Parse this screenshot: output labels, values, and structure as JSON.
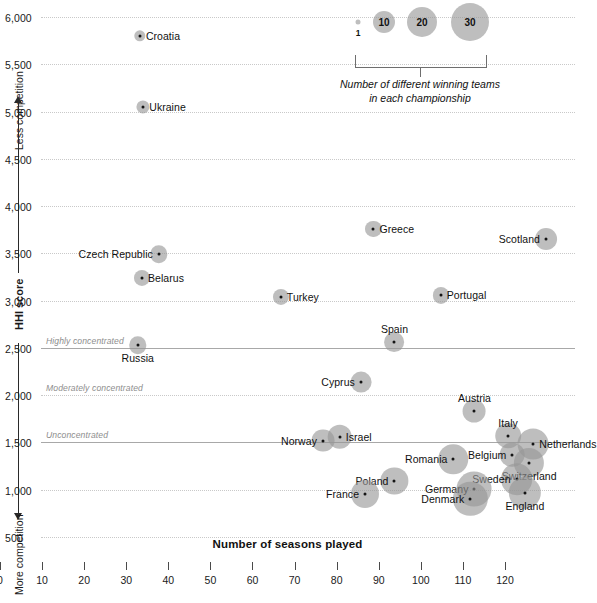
{
  "chart_data": {
    "type": "scatter",
    "title": "",
    "xlabel": "Number of seasons played",
    "ylabel": "HHI score",
    "xlim": [
      0,
      127
    ],
    "ylim": [
      370,
      6200
    ],
    "xticks": [
      0,
      10,
      20,
      30,
      40,
      50,
      60,
      70,
      80,
      90,
      100,
      110,
      120
    ],
    "xtick_labels": [
      "0",
      "10",
      "20",
      "30",
      "40",
      "50",
      "60",
      "70",
      "80",
      "90",
      "100",
      "110",
      "120"
    ],
    "yticks": [
      6000,
      5500,
      5000,
      4500,
      4000,
      3500,
      3000,
      2500,
      2000,
      1500,
      1000,
      500
    ],
    "ytick_labels": [
      "6,000",
      "5,500",
      "5,000",
      "4,500",
      "4,000",
      "3,500",
      "3,000",
      "2,500",
      "2,000",
      "1,500",
      "1,000",
      "500"
    ],
    "grid": "horizontal-dotted",
    "size_meaning": "Number of different winning teams in each championship",
    "thresholds": [
      {
        "label": "Highly concentrated",
        "value": 2500,
        "style": "solid"
      },
      {
        "label": "Moderately concentrated",
        "value": 2000,
        "style": "dotted"
      },
      {
        "label": "Unconcentrated",
        "value": 1500,
        "style": "solid"
      }
    ],
    "points": [
      {
        "name": "Croatia",
        "x": 23.5,
        "y": 5800,
        "teams": 3,
        "label_pos": "right"
      },
      {
        "name": "Ukraine",
        "x": 24.3,
        "y": 5050,
        "teams": 4,
        "label_pos": "right"
      },
      {
        "name": "Greece",
        "x": 79,
        "y": 3760,
        "teams": 6,
        "label_pos": "right"
      },
      {
        "name": "Scotland",
        "x": 120,
        "y": 3650,
        "teams": 11,
        "label_pos": "left"
      },
      {
        "name": "Czech Republic",
        "x": 28,
        "y": 3490,
        "teams": 7,
        "label_pos": "left"
      },
      {
        "name": "Belarus",
        "x": 24,
        "y": 3240,
        "teams": 6,
        "label_pos": "right"
      },
      {
        "name": "Portugal",
        "x": 95,
        "y": 3055,
        "teams": 6,
        "label_pos": "right"
      },
      {
        "name": "Turkey",
        "x": 57,
        "y": 3035,
        "teams": 6,
        "label_pos": "right"
      },
      {
        "name": "Spain",
        "x": 84,
        "y": 2560,
        "teams": 9,
        "label_pos": "above"
      },
      {
        "name": "Russia",
        "x": 23,
        "y": 2530,
        "teams": 7,
        "label_pos": "below"
      },
      {
        "name": "Cyprus",
        "x": 76,
        "y": 2140,
        "teams": 10,
        "label_pos": "left"
      },
      {
        "name": "Austria",
        "x": 103,
        "y": 1830,
        "teams": 12,
        "label_pos": "above"
      },
      {
        "name": "Italy",
        "x": 111,
        "y": 1570,
        "teams": 15,
        "label_pos": "above"
      },
      {
        "name": "Netherlands",
        "x": 117,
        "y": 1480,
        "teams": 22,
        "label_pos": "right"
      },
      {
        "name": "Israel",
        "x": 71,
        "y": 1560,
        "teams": 14,
        "label_pos": "right"
      },
      {
        "name": "Norway",
        "x": 67,
        "y": 1520,
        "teams": 12,
        "label_pos": "left"
      },
      {
        "name": "Belgium",
        "x": 112,
        "y": 1370,
        "teams": 14,
        "label_pos": "left"
      },
      {
        "name": "Romania",
        "x": 98,
        "y": 1320,
        "teams": 20,
        "label_pos": "left"
      },
      {
        "name": "Switzerland",
        "x": 116,
        "y": 1280,
        "teams": 21,
        "label_pos": "below"
      },
      {
        "name": "Sweden",
        "x": 113,
        "y": 1110,
        "teams": 23,
        "label_pos": "left"
      },
      {
        "name": "Poland",
        "x": 84,
        "y": 1090,
        "teams": 17,
        "label_pos": "left"
      },
      {
        "name": "Germany",
        "x": 103,
        "y": 1010,
        "teams": 28,
        "label_pos": "left"
      },
      {
        "name": "England",
        "x": 115,
        "y": 970,
        "teams": 24,
        "label_pos": "below"
      },
      {
        "name": "Denmark",
        "x": 102,
        "y": 900,
        "teams": 27,
        "label_pos": "left"
      },
      {
        "name": "France",
        "x": 77,
        "y": 960,
        "teams": 18,
        "label_pos": "left"
      }
    ]
  },
  "axes": {
    "y_axis_title": "HHI score",
    "y_top_annotation": "Less competition",
    "y_bottom_annotation": "More competition",
    "x_axis_title": "Number of seasons played"
  },
  "legend": {
    "caption_line1": "Number of different winning teams",
    "caption_line2": "in each championship",
    "entries": [
      {
        "label": "1",
        "diameter": 5
      },
      {
        "label": "10",
        "diameter": 22
      },
      {
        "label": "20",
        "diameter": 30
      },
      {
        "label": "30",
        "diameter": 38
      }
    ]
  },
  "colors": {
    "bubble": "#969696",
    "dot": "#141414",
    "gridline": "#c9c9c9",
    "threshold": "#a8a8a8",
    "text": "#1a1a1a",
    "muted": "#8d8d8d"
  }
}
